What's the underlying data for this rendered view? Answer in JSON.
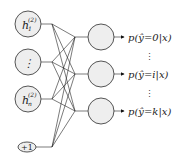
{
  "diagram": {
    "type": "neural-network-softmax-output",
    "input_nodes": [
      {
        "id": "h1",
        "label": "h",
        "sub": "1",
        "sup": "(2)"
      },
      {
        "id": "dots",
        "label": "⋮"
      },
      {
        "id": "hn",
        "label": "h",
        "sub": "n",
        "sup": "(2)"
      },
      {
        "id": "bias",
        "label": "+1"
      }
    ],
    "output_nodes": [
      {
        "id": "o0",
        "output_label": "p(ŷ=0|x)"
      },
      {
        "id": "oi",
        "output_label": "p(ŷ=i|x)"
      },
      {
        "id": "ok",
        "output_label": "p(ŷ=k|x)"
      }
    ],
    "vertical_ellipsis": "⋮",
    "colors": {
      "node_fill": "#eeeeee",
      "node_stroke": "#555555",
      "edge": "#222222"
    }
  }
}
